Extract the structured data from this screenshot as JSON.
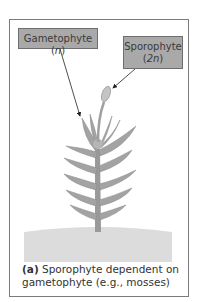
{
  "figure": {
    "labels": {
      "gametophyte": "Gametophyte",
      "gametophyte_ploidy": "n",
      "sporophyte": "Sporophyte",
      "sporophyte_ploidy": "2n"
    },
    "caption": {
      "tag": "(a)",
      "text_line1": " Sporophyte dependent on",
      "text_line2": "gametophyte (e.g., mosses)"
    },
    "colors": {
      "label_fill": "#a9a9a9",
      "plant": "#9e9e9e",
      "ground": "#dcdcdc",
      "frame": "#7a7a7a"
    }
  }
}
